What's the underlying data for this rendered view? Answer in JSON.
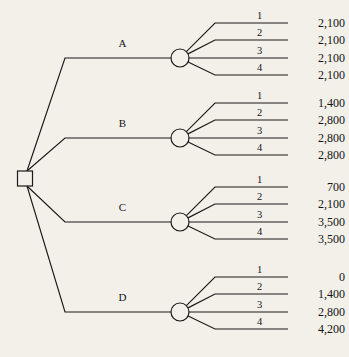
{
  "diagram": {
    "type": "decision-tree",
    "background_color": "#f2f0e9",
    "line_color": "#1a1a1a",
    "root": {
      "node_type": "decision-square",
      "name": "root-decision-node"
    },
    "branches": [
      {
        "label": "A",
        "node_type": "chance-circle",
        "outcomes": [
          {
            "state": "1",
            "payoff": "2,100"
          },
          {
            "state": "2",
            "payoff": "2,100"
          },
          {
            "state": "3",
            "payoff": "2,100"
          },
          {
            "state": "4",
            "payoff": "2,100"
          }
        ]
      },
      {
        "label": "B",
        "node_type": "chance-circle",
        "outcomes": [
          {
            "state": "1",
            "payoff": "1,400"
          },
          {
            "state": "2",
            "payoff": "2,800"
          },
          {
            "state": "3",
            "payoff": "2,800"
          },
          {
            "state": "4",
            "payoff": "2,800"
          }
        ]
      },
      {
        "label": "C",
        "node_type": "chance-circle",
        "outcomes": [
          {
            "state": "1",
            "payoff": "700"
          },
          {
            "state": "2",
            "payoff": "2,100"
          },
          {
            "state": "3",
            "payoff": "3,500"
          },
          {
            "state": "4",
            "payoff": "3,500"
          }
        ]
      },
      {
        "label": "D",
        "node_type": "chance-circle",
        "outcomes": [
          {
            "state": "1",
            "payoff": "0"
          },
          {
            "state": "2",
            "payoff": "1,400"
          },
          {
            "state": "3",
            "payoff": "2,800"
          },
          {
            "state": "4",
            "payoff": "4,200"
          }
        ]
      }
    ]
  },
  "geometry": {
    "root": {
      "x": 25,
      "y": 178.5,
      "half": 7.5
    },
    "bend_x": 65,
    "circle_x": 180,
    "circle_r": 9,
    "group_y": [
      58,
      138,
      222,
      312
    ],
    "outcome_offsets": [
      -35,
      -18,
      0,
      17
    ],
    "fan_start_x": 215,
    "line_end_x": 288,
    "payoff_x": 345,
    "state_label_dy": -4
  }
}
